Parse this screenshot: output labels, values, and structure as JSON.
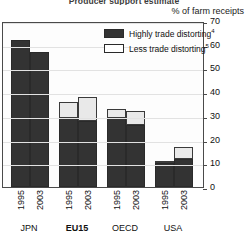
{
  "chart_title": "Producer support estimate",
  "axis_caption": "% of farm receipts",
  "legend": {
    "items": [
      {
        "label": "Highly trade distorting",
        "footnote": "4",
        "swatch": "dark-swatch",
        "color": "#333333"
      },
      {
        "label": "Less trade distorting",
        "footnote": "5",
        "swatch": "light-swatch",
        "color": "#ffffff"
      }
    ]
  },
  "yticks": [
    "70",
    "60",
    "50",
    "40",
    "30",
    "20",
    "10",
    "0"
  ],
  "groups": [
    {
      "name": "JPN",
      "bold": false,
      "years": [
        "1995",
        "2003"
      ]
    },
    {
      "name": "EU15",
      "bold": true,
      "years": [
        "1995",
        "2003"
      ]
    },
    {
      "name": "OECD",
      "bold": false,
      "years": [
        "1995",
        "2003"
      ]
    },
    {
      "name": "USA",
      "bold": false,
      "years": [
        "1995",
        "2003"
      ]
    }
  ],
  "chart_data": {
    "type": "bar",
    "subtype": "stacked",
    "title": "Producer support estimate",
    "xlabel": "",
    "ylabel": "% of farm receipts",
    "ylim": [
      0,
      70
    ],
    "ytick_step": 10,
    "grid": true,
    "legend_position": "top-right-inside",
    "categories": [
      "JPN 1995",
      "JPN 2003",
      "EU15 1995",
      "EU15 2003",
      "OECD 1995",
      "OECD 2003",
      "USA 1995",
      "USA 2003"
    ],
    "series": [
      {
        "name": "Highly trade distorting",
        "footnote": "4",
        "color": "#333333",
        "values": [
          62,
          57,
          29,
          28,
          29,
          26,
          10,
          12
        ]
      },
      {
        "name": "Less trade distorting",
        "footnote": "5",
        "color": "#ffffff",
        "values": [
          0,
          0,
          7,
          10,
          4,
          6,
          1,
          5
        ]
      }
    ],
    "totals": [
      62,
      57,
      36,
      38,
      33,
      32,
      11,
      17
    ]
  }
}
